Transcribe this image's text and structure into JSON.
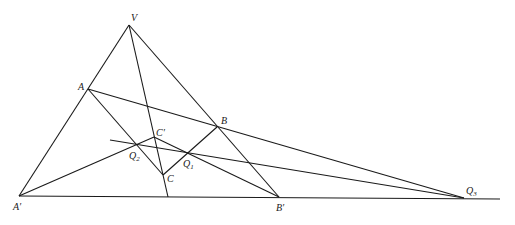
{
  "diagram": {
    "type": "projective-geometry",
    "points": {
      "V": {
        "label": "V",
        "x": 129,
        "y": 25
      },
      "A": {
        "label": "A",
        "x": 88,
        "y": 89
      },
      "B": {
        "label": "B",
        "x": 217,
        "y": 127
      },
      "Cp": {
        "label": "C′",
        "x": 154,
        "y": 137
      },
      "C": {
        "label": "C",
        "x": 163,
        "y": 175
      },
      "Q1": {
        "label": "Q",
        "sub": "1",
        "x": 189,
        "y": 154
      },
      "Q2": {
        "label": "Q",
        "sub": "2",
        "x": 136,
        "y": 145
      },
      "Q3": {
        "label": "Q",
        "sub": "3",
        "x": 464,
        "y": 198
      },
      "Ap": {
        "label": "A′",
        "x": 19,
        "y": 196
      },
      "Bp": {
        "label": "B′",
        "x": 279,
        "y": 197
      }
    },
    "labels": {
      "V": "V",
      "A": "A",
      "B": "B",
      "Cp": "C′",
      "C": "C",
      "Q": "Q",
      "Q1_sub": "1",
      "Q2_sub": "2",
      "Q3_sub": "3",
      "Ap": "A′",
      "Bp": "B′"
    }
  }
}
